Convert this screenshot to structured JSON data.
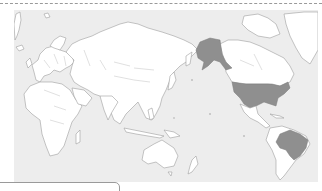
{
  "map": {
    "type": "world-map",
    "projection": "pacific-centered",
    "ocean_color": "#ededed",
    "land_color": "#ffffff",
    "border_color": "#9d9d9d",
    "highlight_color": "#8f8f8f",
    "highlighted_countries": [
      "United States (incl. Alaska)",
      "Brazil"
    ]
  },
  "legend_box": {
    "label": ""
  }
}
